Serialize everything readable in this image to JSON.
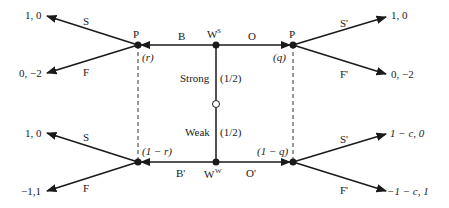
{
  "diagram": {
    "type": "extensive-form game tree (signaling game)",
    "nature": {
      "strong_label": "Strong",
      "strong_prob": "(1/2)",
      "weak_label": "Weak",
      "weak_prob": "(1/2)"
    },
    "nodes": {
      "p_top_left": "P",
      "w_strong": "W",
      "w_strong_sup": "S",
      "p_top_right": "P",
      "w_weak": "W",
      "w_weak_sup": "W"
    },
    "beliefs": {
      "top_left": "(r)",
      "top_right": "(q)",
      "bottom_left": "(1 − r)",
      "bottom_right": "(1 − q)"
    },
    "actions": {
      "top_left_b": "B",
      "top_right_o": "O",
      "bottom_left_b": "B'",
      "bottom_right_o": "O'",
      "tl_s": "S",
      "tl_f": "F",
      "tr_s": "S'",
      "tr_f": "F'",
      "bl_s": "S",
      "bl_f": "F",
      "br_s": "S'",
      "br_f": "F'"
    },
    "payoffs": {
      "tl_s": "1, 0",
      "tl_f": "0, −2",
      "tr_s": "1, 0",
      "tr_f": "0, −2",
      "bl_s": "1, 0",
      "bl_f": "−1,1",
      "br_s": "1 − c, 0",
      "br_f": "−1 − c, 1"
    },
    "colors": {
      "ink": "#1a1a1a",
      "background": "#ffffff"
    }
  }
}
